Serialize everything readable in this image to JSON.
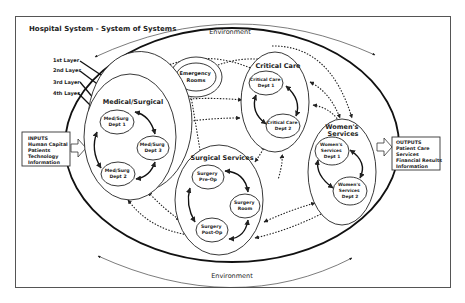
{
  "title": "Hospital System - System of Systems",
  "environment_top": "Environment",
  "environment_bottom": "Environment",
  "layers": [
    "1st Layer",
    "2nd Layer",
    "3rd Layer",
    "4th Layer"
  ],
  "inputs": {
    "heading": "INPUTS",
    "items": [
      "Human Capital",
      "Patients",
      "Technology",
      "Information"
    ]
  },
  "outputs": {
    "heading": "OUTPUTS",
    "items": [
      "Patient Care",
      "Services",
      "Financial Results",
      "Information"
    ]
  },
  "subsystems": {
    "medical_surgical": {
      "label": "Medical/Surgical",
      "depts": [
        [
          "Med/Surg",
          "Dept 1"
        ],
        [
          "Med/Surg",
          "Dept 3"
        ],
        [
          "Med/Surg",
          "Dept 2"
        ]
      ]
    },
    "emergency": {
      "label": [
        "Emergency",
        "Rooms"
      ]
    },
    "critical_care": {
      "label": "Critical Care",
      "depts": [
        [
          "Critical Care",
          "Dept 1"
        ],
        [
          "Critical Care",
          "Dept 2"
        ]
      ]
    },
    "surgical_services": {
      "label": "Surgical Services",
      "depts": [
        [
          "Surgery",
          "Pre-Op"
        ],
        [
          "Surgery",
          "Room"
        ],
        [
          "Surgery",
          "Post-Op"
        ]
      ]
    },
    "womens_services": {
      "label": [
        "Women's",
        "Services"
      ],
      "depts": [
        [
          "Women's",
          "Services",
          "Dept 1"
        ],
        [
          "Women's",
          "Services",
          "Dept 2"
        ]
      ]
    }
  },
  "colors": {
    "line": "#222222",
    "frame": "#555555",
    "background": "#ffffff"
  }
}
